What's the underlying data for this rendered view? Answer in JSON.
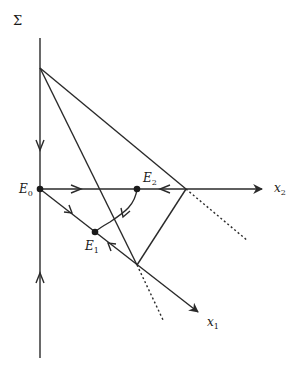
{
  "diagram": {
    "type": "phase-portrait",
    "colors": {
      "stroke": "#2a2a2a",
      "background": "#ffffff"
    },
    "labels": {
      "sigma": "Σ",
      "x1_base": "x",
      "x1_sub": "1",
      "x2_base": "x",
      "x2_sub": "2",
      "E0_base": "E",
      "E0_sub": "0",
      "E1_base": "E",
      "E1_sub": "1",
      "E2_base": "E",
      "E2_sub": "2"
    },
    "equilibria": [
      {
        "name": "E0",
        "x": 40,
        "y": 189
      },
      {
        "name": "E1",
        "x": 95,
        "y": 232
      },
      {
        "name": "E2",
        "x": 137,
        "y": 189
      }
    ],
    "vertices": {
      "top": {
        "x": 40,
        "y": 68
      },
      "right": {
        "x": 186,
        "y": 189
      },
      "bottom": {
        "x": 137,
        "y": 265
      }
    },
    "axes": {
      "sigma_axis": {
        "from": [
          40,
          358
        ],
        "to": [
          40,
          38
        ]
      },
      "x2_axis": {
        "from": [
          40,
          189
        ],
        "to": [
          263,
          189
        ]
      },
      "x1_axis": {
        "from": [
          40,
          189
        ],
        "to": [
          199,
          313
        ]
      }
    }
  }
}
